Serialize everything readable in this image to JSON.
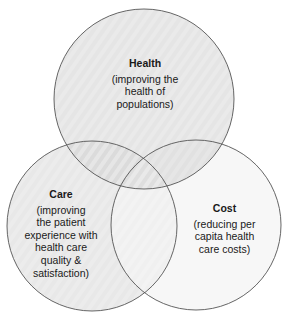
{
  "diagram": {
    "type": "venn",
    "colors": {
      "stroke": "#555555",
      "health_fill": "#d9d9d9",
      "care_fill": "#e2e2e2",
      "cost_fill": "#f7f7f7",
      "background": "#ffffff"
    },
    "circles": [
      {
        "id": "health",
        "title": "Health",
        "description": "(improving the\nhealth of\npopulations)"
      },
      {
        "id": "care",
        "title": "Care",
        "description": "(improving\nthe patient\nexperience with\nhealth care\nquality &\nsatisfaction)"
      },
      {
        "id": "cost",
        "title": "Cost",
        "description": "(reducing per\ncapita health\ncare costs)"
      }
    ]
  }
}
